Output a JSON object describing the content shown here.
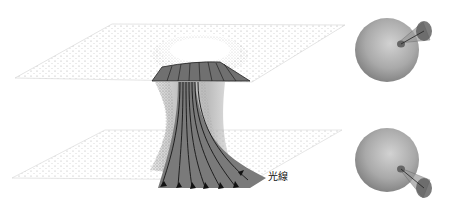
{
  "figure": {
    "label_rays": "光線",
    "colors": {
      "sheet_dots": "#9a9a9a",
      "throat_band": "#6e6e6e",
      "ray_lines": "#1a1a1a",
      "sphere": "#a8a8a8",
      "cone": "#555555"
    },
    "spheres": [
      {
        "position": "top",
        "cone_direction": "up-right"
      },
      {
        "position": "bottom",
        "cone_direction": "down-right"
      }
    ],
    "ray_count": 7
  }
}
